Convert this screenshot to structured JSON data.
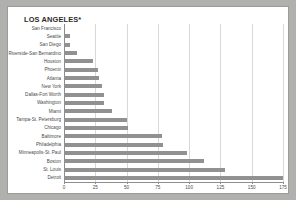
{
  "chart_data": {
    "type": "bar",
    "orientation": "horizontal",
    "title": "LOS ANGELES*",
    "xlabel": "",
    "ylabel": "",
    "xlim": [
      0,
      175
    ],
    "grid": true,
    "legend": false,
    "xticks": [
      0,
      25,
      50,
      75,
      100,
      125,
      150,
      175
    ],
    "xtick_labels": [
      "0",
      "25",
      "50",
      "75",
      "100",
      "125",
      "150",
      "175"
    ],
    "categories": [
      "San Francisco",
      "Seattle",
      "San Diego",
      "Riverside-San Bernardino",
      "Houston",
      "Phoenix",
      "Atlanta",
      "New York",
      "Dallas-Fort Worth",
      "Washington",
      "Miami",
      "Tampa-St. Petersburg",
      "Chicago",
      "Baltimore",
      "Philadelphia",
      "Minneapolis-St. Paul",
      "Boston",
      "St. Louis",
      "Detroit"
    ],
    "values": [
      0,
      5,
      5,
      10,
      23,
      27,
      28,
      30,
      32,
      32,
      38,
      50,
      51,
      78,
      79,
      98,
      112,
      129,
      175
    ],
    "bar_color": "#919191"
  },
  "colors": {
    "background": "#b0b0ae",
    "panel": "#ffffff",
    "border": "#9b9b99",
    "bar": "#919191",
    "grid": "#d8d8d8",
    "axis": "#8c8c8c",
    "text": "#4a4a4a",
    "title": "#2b2b2b"
  }
}
